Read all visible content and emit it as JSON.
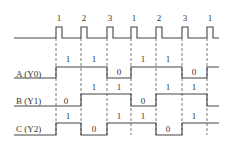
{
  "diagram": {
    "type": "timing-diagram",
    "clock": {
      "pulse_labels": [
        "1",
        "2",
        "3",
        "1",
        "2",
        "3",
        "1"
      ]
    },
    "signals": [
      {
        "name": "A (Y0)",
        "values": [
          "1",
          "1",
          "0",
          "1",
          "1",
          "0"
        ]
      },
      {
        "name": "B (Y1)",
        "values": [
          "0",
          "1",
          "1",
          "0",
          "1",
          "1"
        ]
      },
      {
        "name": "C (Y2)",
        "values": [
          "1",
          "0",
          "1",
          "1",
          "0",
          "1"
        ]
      }
    ]
  }
}
